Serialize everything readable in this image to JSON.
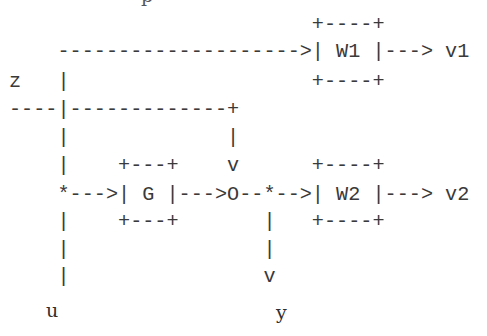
{
  "diagram": {
    "type": "ascii-block-diagram",
    "top_clipped_glyph": "p",
    "rows": [
      "                         +----+",
      "    -------------------->| W1 |---> v1",
      "z   |                    +----+",
      "----|-------------+",
      "    |             |",
      "    |    +---+    v      +----+",
      "    *--->| G |--->O--*-->| W2 |---> v2",
      "    |    +---+       |   +----+",
      "    |                |",
      "    |                v"
    ],
    "labels": {
      "u": "u",
      "y": "y"
    },
    "blocks": [
      {
        "name": "W1",
        "input": "z",
        "output": "v1"
      },
      {
        "name": "G",
        "input": "u",
        "output": "summing-junction"
      },
      {
        "name": "W2",
        "input": "y",
        "output": "v2"
      }
    ],
    "signals": {
      "z": "z",
      "u": "u",
      "y": "y",
      "v1": "v1",
      "v2": "v2"
    },
    "junction_symbol": "O",
    "branch_symbol": "*"
  }
}
